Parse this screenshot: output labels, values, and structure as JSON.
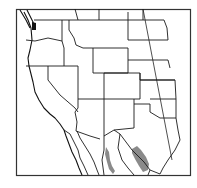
{
  "map": {
    "title": "",
    "region": "Western United States and northern Mexico",
    "type": "species range map",
    "colors": {
      "background": "#ffffff",
      "frame": "#333333",
      "borders": "#1a1a1a",
      "range_fill": "#8a8a8a"
    },
    "range_areas": [
      {
        "name": "western-range-patch",
        "location": "Sonora / Sierra Madre Occidental"
      },
      {
        "name": "eastern-range-patch",
        "location": "Coahuila / Nuevo León (Sierra Madre Oriental)"
      }
    ]
  }
}
